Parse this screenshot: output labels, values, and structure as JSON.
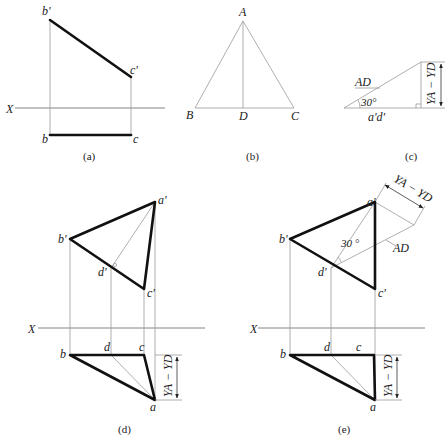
{
  "figures": {
    "a": {
      "caption": "(a)",
      "axis_label": "X",
      "points": {
        "b_prime": "b'",
        "c_prime": "c'",
        "b": "b",
        "c": "c"
      }
    },
    "b": {
      "caption": "(b)",
      "points": {
        "A": "A",
        "B": "B",
        "C": "C",
        "D": "D"
      }
    },
    "c": {
      "caption": "(c)",
      "hypotenuse_label": "AD",
      "angle_label": "30°",
      "base_label": "a'd'",
      "height_label": "YA − YD"
    },
    "d": {
      "caption": "(d)",
      "axis_label": "X",
      "points": {
        "a_prime": "a'",
        "b_prime": "b'",
        "c_prime": "c'",
        "d_prime": "d'",
        "a": "a",
        "b": "b",
        "c": "c",
        "d": "d"
      },
      "dimension_label": "YA − YD"
    },
    "e": {
      "caption": "(e)",
      "axis_label": "X",
      "points": {
        "a_prime": "a'",
        "b_prime": "b'",
        "c_prime": "c'",
        "d_prime": "d'",
        "a": "a",
        "b": "b",
        "c": "c",
        "d": "d"
      },
      "dimension_label": "YA − YD",
      "angle_label": "30 °",
      "true_length_label": "AD",
      "offset_label": "YA − YD"
    }
  }
}
